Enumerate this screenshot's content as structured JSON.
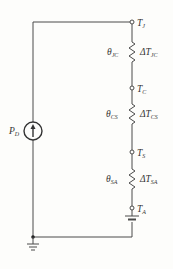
{
  "diagram": {
    "source": {
      "label": "P",
      "subscript": "D"
    },
    "nodes": [
      {
        "id": "TJ",
        "label": "T",
        "subscript": "J"
      },
      {
        "id": "TC",
        "label": "T",
        "subscript": "C"
      },
      {
        "id": "TS",
        "label": "T",
        "subscript": "S"
      },
      {
        "id": "TA",
        "label": "T",
        "subscript": "A"
      }
    ],
    "resistors": [
      {
        "theta": "θ",
        "theta_sub": "JC",
        "delta": "ΔT",
        "delta_sub": "JC"
      },
      {
        "theta": "θ",
        "theta_sub": "CS",
        "delta": "ΔT",
        "delta_sub": "CS"
      },
      {
        "theta": "θ",
        "theta_sub": "SA",
        "delta": "ΔT",
        "delta_sub": "SA"
      }
    ],
    "colors": {
      "wire": "#4a4a4a",
      "background": "#fdfdfb",
      "text": "#333333"
    }
  }
}
